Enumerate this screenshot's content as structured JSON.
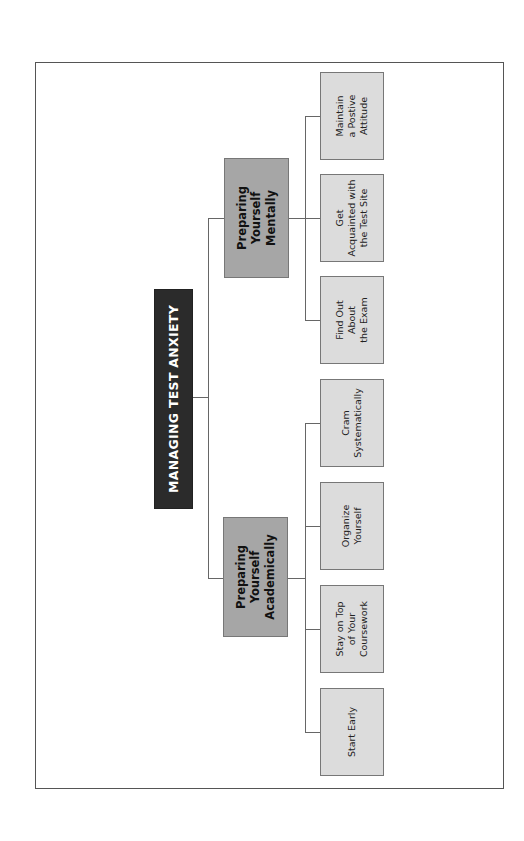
{
  "diagram": {
    "title": "MANAGING TEST ANXIETY",
    "branches": [
      {
        "label": "Preparing\nYourself\nMentally",
        "children": [
          {
            "label": "Maintain\na Postive\nAttitude"
          },
          {
            "label": "Get\nAcquainted with\nthe Test Site"
          },
          {
            "label": "Find Out\nAbout\nthe Exam"
          }
        ]
      },
      {
        "label": "Preparing\nYourself\nAcademically",
        "children": [
          {
            "label": "Cram\nSystematically"
          },
          {
            "label": "Organize\nYourself"
          },
          {
            "label": "Stay on Top\nof Your\nCoursework"
          },
          {
            "label": "Start Early"
          }
        ]
      }
    ]
  },
  "colors": {
    "root_fill": "#2b2b2b",
    "branch_fill": "#a6a6a6",
    "leaf_fill": "#dcdcdc",
    "line": "#666666"
  }
}
